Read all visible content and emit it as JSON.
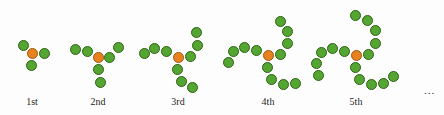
{
  "figure": {
    "background_color": "#fdfdfd",
    "node_colors": {
      "center": "#e8821e",
      "center_border": "#9c5810",
      "branch": "#55a532",
      "branch_border": "#2c6414"
    },
    "node_diameter_px": 11,
    "continuation_label": "...",
    "panels": [
      {
        "label": "1st",
        "label_x": 32,
        "label_y": 96,
        "center": {
          "x": 32,
          "y": 53
        },
        "branch_length": 1,
        "branches": [
          {
            "name": "upper-left",
            "nodes": [
              {
                "x": 23,
                "y": 45
              }
            ]
          },
          {
            "name": "right",
            "nodes": [
              {
                "x": 44,
                "y": 53
              }
            ]
          },
          {
            "name": "lower",
            "nodes": [
              {
                "x": 31,
                "y": 65
              }
            ]
          }
        ]
      },
      {
        "label": "2nd",
        "label_x": 98,
        "label_y": 96,
        "center": {
          "x": 98,
          "y": 57
        },
        "branch_length": 2,
        "branches": [
          {
            "name": "upper-left",
            "nodes": [
              {
                "x": 87,
                "y": 51
              },
              {
                "x": 75,
                "y": 49
              }
            ]
          },
          {
            "name": "upper-right",
            "nodes": [
              {
                "x": 109,
                "y": 57
              },
              {
                "x": 118,
                "y": 47
              }
            ]
          },
          {
            "name": "lower",
            "nodes": [
              {
                "x": 98,
                "y": 69
              },
              {
                "x": 100,
                "y": 82
              }
            ]
          }
        ]
      },
      {
        "label": "3rd",
        "label_x": 178,
        "label_y": 96,
        "center": {
          "x": 178,
          "y": 57
        },
        "branch_length": 3,
        "branches": [
          {
            "name": "upper-left",
            "nodes": [
              {
                "x": 166,
                "y": 51
              },
              {
                "x": 154,
                "y": 48
              },
              {
                "x": 144,
                "y": 53
              }
            ]
          },
          {
            "name": "upper-right",
            "nodes": [
              {
                "x": 190,
                "y": 56
              },
              {
                "x": 197,
                "y": 45
              },
              {
                "x": 196,
                "y": 32
              }
            ]
          },
          {
            "name": "lower",
            "nodes": [
              {
                "x": 177,
                "y": 69
              },
              {
                "x": 181,
                "y": 81
              },
              {
                "x": 192,
                "y": 87
              }
            ]
          }
        ]
      },
      {
        "label": "4th",
        "label_x": 268,
        "label_y": 96,
        "center": {
          "x": 268,
          "y": 55
        },
        "branch_length": 4,
        "branches": [
          {
            "name": "upper-left",
            "nodes": [
              {
                "x": 256,
                "y": 50
              },
              {
                "x": 244,
                "y": 47
              },
              {
                "x": 233,
                "y": 51
              },
              {
                "x": 228,
                "y": 62
              }
            ]
          },
          {
            "name": "upper-right",
            "nodes": [
              {
                "x": 280,
                "y": 54
              },
              {
                "x": 287,
                "y": 43
              },
              {
                "x": 287,
                "y": 31
              },
              {
                "x": 280,
                "y": 21
              }
            ]
          },
          {
            "name": "lower",
            "nodes": [
              {
                "x": 267,
                "y": 67
              },
              {
                "x": 271,
                "y": 79
              },
              {
                "x": 283,
                "y": 84
              },
              {
                "x": 295,
                "y": 83
              }
            ]
          }
        ]
      },
      {
        "label": "5th",
        "label_x": 356,
        "label_y": 96,
        "center": {
          "x": 356,
          "y": 55
        },
        "branch_length": 5,
        "branches": [
          {
            "name": "upper-left",
            "nodes": [
              {
                "x": 344,
                "y": 51
              },
              {
                "x": 332,
                "y": 48
              },
              {
                "x": 321,
                "y": 52
              },
              {
                "x": 316,
                "y": 63
              },
              {
                "x": 318,
                "y": 75
              }
            ]
          },
          {
            "name": "upper-right",
            "nodes": [
              {
                "x": 368,
                "y": 54
              },
              {
                "x": 375,
                "y": 43
              },
              {
                "x": 375,
                "y": 30
              },
              {
                "x": 367,
                "y": 20
              },
              {
                "x": 355,
                "y": 15
              }
            ]
          },
          {
            "name": "lower",
            "nodes": [
              {
                "x": 355,
                "y": 67
              },
              {
                "x": 359,
                "y": 79
              },
              {
                "x": 371,
                "y": 84
              },
              {
                "x": 383,
                "y": 83
              },
              {
                "x": 393,
                "y": 76
              }
            ]
          }
        ]
      }
    ],
    "continuation": {
      "x": 424,
      "y": 84
    }
  }
}
